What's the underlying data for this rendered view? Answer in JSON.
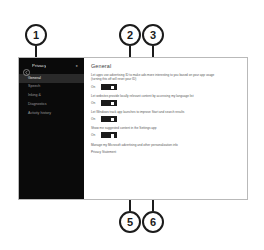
{
  "figure": {
    "kind": "annotated-screenshot",
    "line_color": "#1b1b1b",
    "callouts": [
      {
        "number": "1",
        "points_to": "privacy-sidebar-navigation"
      },
      {
        "number": "2",
        "points_to": "advertising-id-toggle"
      },
      {
        "number": "3",
        "points_to": "website-language-list-toggle"
      },
      {
        "number": "5",
        "points_to": "inking-typing-personalization-toggle"
      },
      {
        "number": "6",
        "points_to": "track-app-launches-toggle"
      }
    ]
  },
  "window": {
    "sidebar": {
      "back_icon": "back-arrow-icon",
      "title": "Privacy",
      "pin_icon": "pin-icon",
      "items": [
        {
          "label": "General",
          "active": true
        },
        {
          "label": "Speech",
          "active": false
        },
        {
          "label": "Inking &",
          "active": false
        },
        {
          "label": "Diagnostics",
          "active": false
        },
        {
          "label": "Activity history",
          "active": false
        }
      ]
    },
    "main": {
      "title": "General",
      "settings": [
        {
          "description": "Let apps use advertising ID to make ads more interesting to you based on your app usage (turning this off will reset your ID)",
          "state_label": "On",
          "toggle_on": true
        },
        {
          "description": "Let websites provide locally relevant content by accessing my language list",
          "state_label": "On",
          "toggle_on": true
        },
        {
          "description": "Let Windows track app launches to improve Start and search results",
          "state_label": "On",
          "toggle_on": true
        },
        {
          "description": "Show me suggested content in the Settings app",
          "state_label": "On",
          "toggle_on": true
        }
      ],
      "links": [
        "Manage my Microsoft advertising and other personalization info",
        "Privacy Statement"
      ]
    }
  }
}
